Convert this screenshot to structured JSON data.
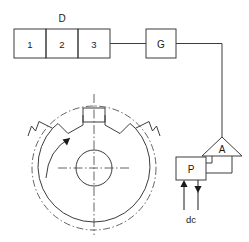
{
  "diagram": {
    "stroke_color": "#3d3d3d",
    "accent_color": "#1a1a1a",
    "background": "#ffffff"
  },
  "decoder": {
    "label": "D",
    "cells": [
      {
        "label": "1"
      },
      {
        "label": "2"
      },
      {
        "label": "3"
      }
    ]
  },
  "gate": {
    "label": "G"
  },
  "amplifier": {
    "label": "A"
  },
  "power": {
    "label": "P"
  },
  "supply": {
    "label": "dc",
    "arrows": [
      {
        "name": "supply-arrow-up",
        "direction": "up"
      },
      {
        "name": "supply-arrow-down",
        "direction": "down"
      }
    ]
  },
  "rotor": {
    "name": "notched-rotor-disc",
    "rotation_label": "",
    "teeth": 3,
    "hub_label": ""
  }
}
